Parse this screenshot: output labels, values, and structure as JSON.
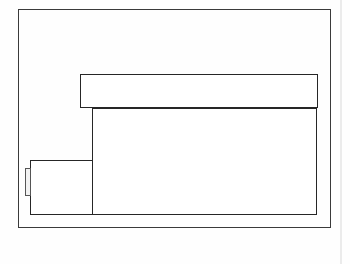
{
  "document": {
    "title": "Technical Line Drawing",
    "type": "line-drawing",
    "background_color": "#ffffff",
    "line_color": "#262626",
    "frame_color": "#3a3a3a",
    "detail_fill_color": "#f2f2f2",
    "artifact_color": "#ebebeb",
    "canvas": {
      "width": 350,
      "height": 264
    }
  },
  "shapes": [
    {
      "id": "outer-frame",
      "name": "outer-frame",
      "role": "enclosing border rectangle",
      "x": 18,
      "y": 9,
      "width": 313,
      "height": 219,
      "stroke": "#3a3a3a",
      "stroke_width": 1.4,
      "fill": "none",
      "label": ""
    },
    {
      "id": "top-bar",
      "name": "top-horizontal-bar",
      "role": "wide horizontal band near top",
      "x": 80,
      "y": 74,
      "width": 238,
      "height": 34,
      "stroke": "#262626",
      "stroke_width": 1.6,
      "fill": "#ffffff",
      "label": ""
    },
    {
      "id": "main-body",
      "name": "main-body-rectangle",
      "role": "large lower rectangle body",
      "x": 92,
      "y": 108,
      "width": 225,
      "height": 107,
      "stroke": "#262626",
      "stroke_width": 1.6,
      "fill": "#ffffff",
      "label": ""
    },
    {
      "id": "left-box",
      "name": "left-side-box",
      "role": "small rectangle attached at lower left",
      "x": 30,
      "y": 160,
      "width": 63,
      "height": 55,
      "stroke": "#262626",
      "stroke_width": 1.6,
      "fill": "#ffffff",
      "label": ""
    },
    {
      "id": "left-tab",
      "name": "left-edge-tab",
      "role": "narrow vertical tab on far left of small box",
      "x": 25,
      "y": 168,
      "width": 6,
      "height": 28,
      "stroke": "#555555",
      "stroke_width": 1.3,
      "fill": "#f2f2f2",
      "label": ""
    }
  ],
  "artifacts": [
    {
      "id": "right-page-edge",
      "name": "page-edge-artifact",
      "x": 340,
      "y": 0,
      "width": 2,
      "height": 264,
      "color": "#ebebeb"
    }
  ],
  "annotations": {
    "text_items": [],
    "note": ""
  }
}
